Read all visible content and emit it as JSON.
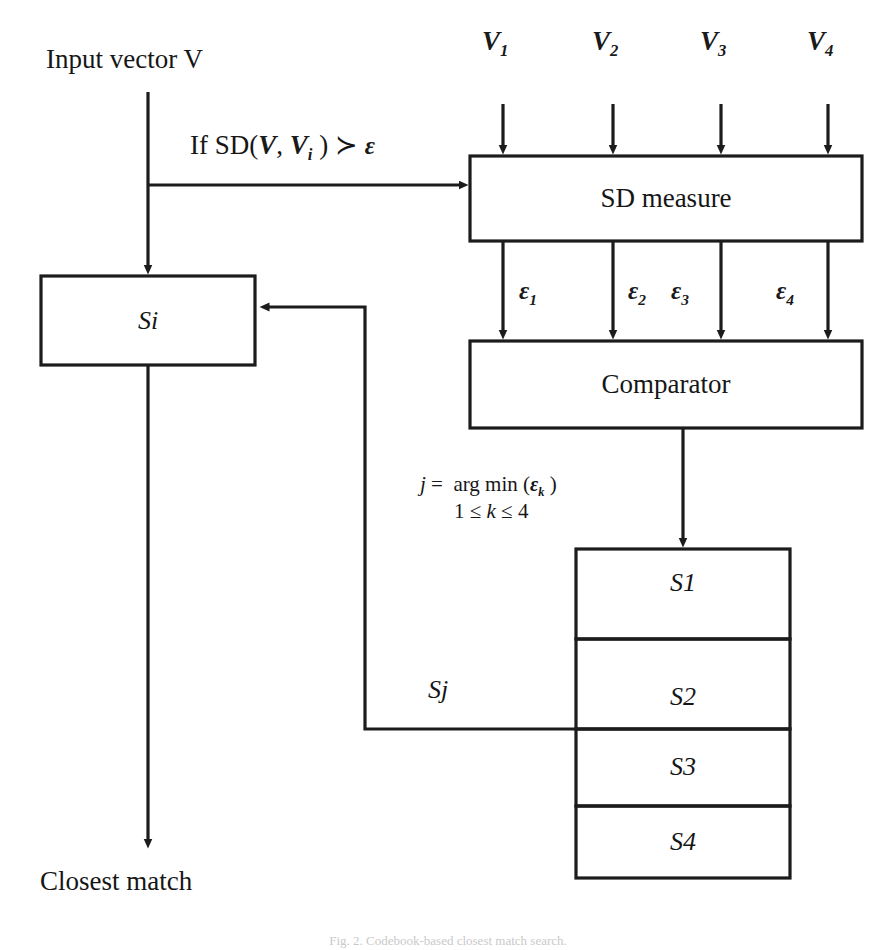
{
  "figure": {
    "title_text": "Closest match block diagram",
    "caption": "Fig. 2.  Codebook-based closest match search.",
    "line_color": "#1c1c1c",
    "background": "#ffffff"
  },
  "inputs": {
    "vector_label": "Input vector V",
    "condition_label": "If SD(V, Vi ) ≻ ε",
    "codeword_labels": [
      "V1",
      "V2",
      "V3",
      "V4"
    ],
    "codeword_base": "V",
    "codeword_subscripts": [
      "1",
      "2",
      "3",
      "4"
    ]
  },
  "blocks": {
    "sd_measure": {
      "label": "SD measure"
    },
    "comparator": {
      "label": "Comparator"
    },
    "si": {
      "label": "Si"
    }
  },
  "signals": {
    "epsilon_base": "ε",
    "epsilon_subscripts": [
      "1",
      "2",
      "3",
      "4"
    ],
    "epsilon_labels": [
      "ε1",
      "ε2",
      "ε3",
      "ε4"
    ],
    "selection_rule_line1": "j =  arg min (εk)",
    "selection_rule_line2": "1 ≤ k ≤ 4",
    "selected_label": "Sj"
  },
  "codebook": {
    "entries": [
      {
        "label": "S1"
      },
      {
        "label": "S2"
      },
      {
        "label": "S3"
      },
      {
        "label": "S4"
      }
    ]
  },
  "output": {
    "label": "Closest match"
  }
}
